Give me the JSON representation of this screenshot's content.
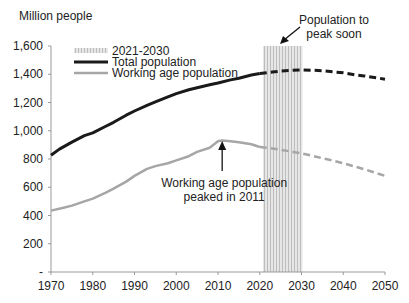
{
  "chart_data": {
    "type": "line",
    "title": "",
    "ylabel": "Million people",
    "xlabel": "",
    "ylim": [
      0,
      1600
    ],
    "xlim": [
      1970,
      2050
    ],
    "yticks": [
      0,
      200,
      400,
      600,
      800,
      1000,
      1200,
      1400,
      1600
    ],
    "ytick_labels": [
      "-",
      "200",
      "400",
      "600",
      "800",
      "1,000",
      "1,200",
      "1,400",
      "1,600"
    ],
    "xticks": [
      1970,
      1980,
      1990,
      2000,
      2010,
      2020,
      2030,
      2040,
      2050
    ],
    "grid": false,
    "legend_position": "top-left",
    "legend": [
      "2021-2030",
      "Total population",
      "Working age population"
    ],
    "shaded_region": {
      "label": "2021-2030",
      "x0": 2021,
      "x1": 2030
    },
    "series": [
      {
        "name": "Total population",
        "color": "#1a1a1a",
        "actual": {
          "x": [
            1970,
            1972,
            1975,
            1978,
            1980,
            1983,
            1985,
            1988,
            1990,
            1993,
            1995,
            1998,
            2000,
            2003,
            2005,
            2008,
            2010,
            2013,
            2015,
            2018,
            2020
          ],
          "y": [
            827,
            870,
            920,
            965,
            985,
            1030,
            1060,
            1110,
            1140,
            1180,
            1205,
            1240,
            1263,
            1290,
            1305,
            1325,
            1338,
            1360,
            1372,
            1395,
            1405
          ]
        },
        "projection": {
          "x": [
            2020,
            2023,
            2025,
            2028,
            2030,
            2033,
            2035,
            2038,
            2040,
            2043,
            2045,
            2048,
            2050
          ],
          "y": [
            1405,
            1415,
            1422,
            1428,
            1430,
            1428,
            1425,
            1415,
            1410,
            1395,
            1388,
            1375,
            1365
          ]
        }
      },
      {
        "name": "Working age population",
        "color": "#a6a6a6",
        "actual": {
          "x": [
            1970,
            1973,
            1975,
            1978,
            1980,
            1983,
            1985,
            1988,
            1990,
            1993,
            1995,
            1998,
            2000,
            2003,
            2005,
            2008,
            2010,
            2011,
            2013,
            2015,
            2018,
            2020
          ],
          "y": [
            435,
            455,
            470,
            500,
            520,
            560,
            590,
            640,
            680,
            730,
            750,
            770,
            790,
            820,
            850,
            880,
            925,
            930,
            925,
            918,
            905,
            885
          ]
        },
        "projection": {
          "x": [
            2020,
            2023,
            2025,
            2028,
            2030,
            2033,
            2035,
            2038,
            2040,
            2043,
            2045,
            2048,
            2050
          ],
          "y": [
            885,
            875,
            865,
            850,
            840,
            820,
            805,
            785,
            770,
            745,
            728,
            700,
            680
          ]
        }
      }
    ],
    "annotations": [
      {
        "text_lines": [
          "Population to",
          "peak soon"
        ],
        "arrow_target_x": 2022,
        "arrow_target_y": 1580
      },
      {
        "text_lines": [
          "Working age population",
          "peaked in 2011"
        ],
        "arrow_target_x": 2011,
        "arrow_target_y": 900
      }
    ]
  }
}
